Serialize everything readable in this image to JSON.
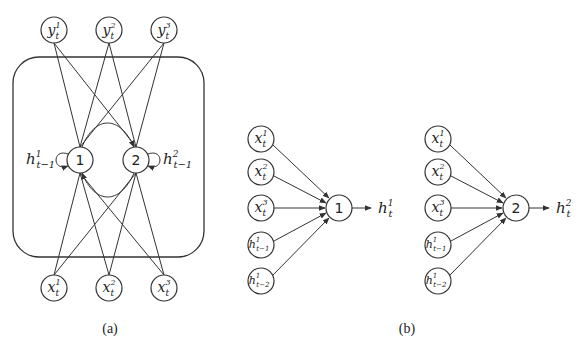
{
  "figure": {
    "panel_a": {
      "caption": "(a)",
      "outputs": [
        {
          "base": "y",
          "sub": "t",
          "sup": "1"
        },
        {
          "base": "y",
          "sub": "t",
          "sup": "2"
        },
        {
          "base": "y",
          "sub": "t",
          "sup": "3"
        }
      ],
      "hidden": [
        {
          "label": "1",
          "recurrent_label": {
            "base": "h",
            "sub": "t−1",
            "sup": "1"
          }
        },
        {
          "label": "2",
          "recurrent_label": {
            "base": "h",
            "sub": "t−1",
            "sup": "2"
          }
        }
      ],
      "inputs": [
        {
          "base": "x",
          "sub": "t",
          "sup": "1"
        },
        {
          "base": "x",
          "sub": "t",
          "sup": "2"
        },
        {
          "base": "x",
          "sub": "t",
          "sup": "3"
        }
      ]
    },
    "panel_b": {
      "caption": "(b)",
      "units": [
        {
          "label": "1",
          "inputs": [
            {
              "base": "x",
              "sub": "t",
              "sup": "1"
            },
            {
              "base": "x",
              "sub": "t",
              "sup": "2"
            },
            {
              "base": "x",
              "sub": "t",
              "sup": "3"
            },
            {
              "base": "h",
              "sub": "t−1",
              "sup": "1"
            },
            {
              "base": "h",
              "sub": "t−2",
              "sup": "1"
            }
          ],
          "output": {
            "base": "h",
            "sub": "t",
            "sup": "1"
          }
        },
        {
          "label": "2",
          "inputs": [
            {
              "base": "x",
              "sub": "t",
              "sup": "1"
            },
            {
              "base": "x",
              "sub": "t",
              "sup": "2"
            },
            {
              "base": "x",
              "sub": "t",
              "sup": "3"
            },
            {
              "base": "h",
              "sub": "t−1",
              "sup": "1"
            },
            {
              "base": "h",
              "sub": "t−2",
              "sup": "1"
            }
          ],
          "output": {
            "base": "h",
            "sub": "t",
            "sup": "2"
          }
        }
      ]
    }
  }
}
